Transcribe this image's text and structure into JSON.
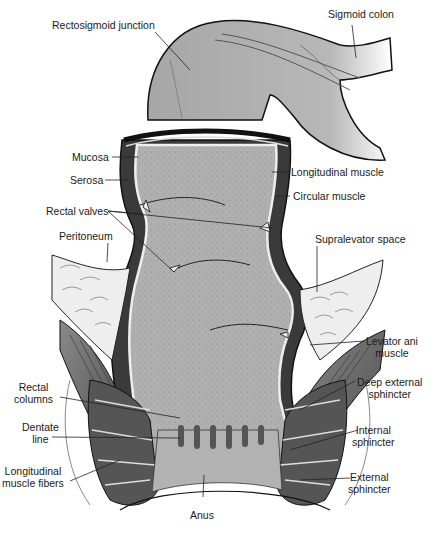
{
  "diagram": {
    "colors": {
      "tissue_fill": "#a9a9a9",
      "lumen_fill": "#b4b4b4",
      "wall_dark": "#3a3a3a",
      "fat_fill": "#ececec",
      "muscle_fill": "#6e6e6e",
      "outline": "#111111",
      "label_text": "#1a1a1a"
    },
    "labels": {
      "rectosigmoid_junction": "Rectosigmoid junction",
      "sigmoid_colon": "Sigmoid colon",
      "mucosa": "Mucosa",
      "serosa": "Serosa",
      "longitudinal_muscle": "Longitudinal muscle",
      "circular_muscle": "Circular muscle",
      "rectal_valves": "Rectal valves",
      "peritoneum": "Peritoneum",
      "supralevator_space": "Supralevator space",
      "levator_ani_1": "Levator ani",
      "levator_ani_2": "muscle",
      "rectal_columns_1": "Rectal",
      "rectal_columns_2": "columns",
      "deep_external_sphincter_1": "Deep external",
      "deep_external_sphincter_2": "sphincter",
      "dentate_line_1": "Dentate",
      "dentate_line_2": "line",
      "internal_sphincter_1": "Internal",
      "internal_sphincter_2": "sphincter",
      "longitudinal_muscle_fibers_1": "Longitudinal",
      "longitudinal_muscle_fibers_2": "muscle fibers",
      "external_sphincter_1": "External",
      "external_sphincter_2": "sphincter",
      "anus": "Anus"
    }
  }
}
